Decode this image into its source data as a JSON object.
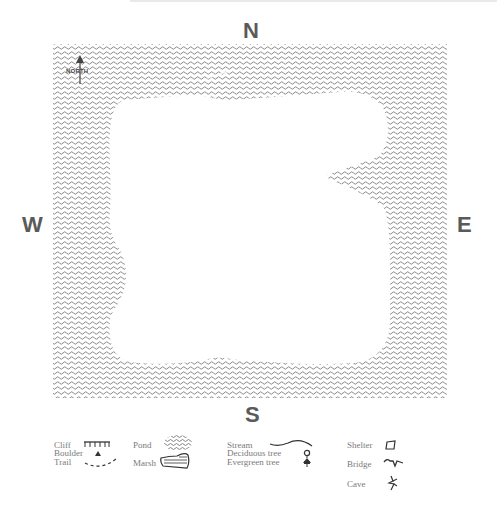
{
  "map": {
    "compass": {
      "north": "N",
      "south": "S",
      "west": "W",
      "east": "E"
    },
    "north_arrow_label": "NORTH",
    "colors": {
      "water_pattern": "#8a8a8a",
      "land": "#ffffff",
      "label": "#5a5a5a",
      "legend_text": "#7a7a7a"
    }
  },
  "legend": {
    "columns": [
      {
        "items": [
          {
            "label": "Cliff",
            "icon": "cliff-icon"
          },
          {
            "label": "Boulder",
            "icon": "boulder-icon"
          },
          {
            "label": "Trail",
            "icon": "trail-icon"
          }
        ]
      },
      {
        "items": [
          {
            "label": "Pond",
            "icon": "pond-icon"
          },
          {
            "label": "Marsh",
            "icon": "marsh-icon"
          }
        ]
      },
      {
        "items": [
          {
            "label": "Stream",
            "icon": "stream-icon"
          },
          {
            "label": "Deciduous tree",
            "icon": "deciduous-tree-icon"
          },
          {
            "label": "Evergreen tree",
            "icon": "evergreen-tree-icon"
          }
        ]
      },
      {
        "items": [
          {
            "label": "Shelter",
            "icon": "shelter-icon"
          },
          {
            "label": "Bridge",
            "icon": "bridge-icon"
          },
          {
            "label": "Cave",
            "icon": "cave-icon"
          }
        ]
      }
    ]
  }
}
